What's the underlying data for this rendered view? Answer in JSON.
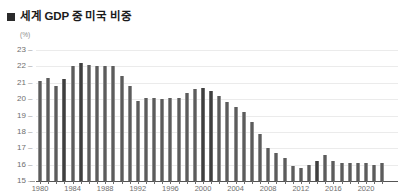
{
  "title": {
    "bullet": "square-bullet",
    "text": "세계 GDP 중 미국 비중"
  },
  "chart_data": {
    "type": "bar",
    "title": "세계 GDP 중 미국 비중",
    "unit_label": "(%)",
    "xlabel": "",
    "ylabel": "",
    "ylim": [
      15,
      23
    ],
    "ytick_values": [
      23,
      22,
      21,
      20,
      19,
      18,
      17,
      16,
      15
    ],
    "ytick_labels": [
      "23",
      "22",
      "21",
      "20",
      "19",
      "18",
      "17",
      "16",
      "15"
    ],
    "grid": true,
    "legend": "none",
    "xtick_labels": [
      "1980",
      "1984",
      "1988",
      "1992",
      "1996",
      "2000",
      "2004",
      "2008",
      "2012",
      "2016",
      "2020"
    ],
    "xtick_years": [
      1980,
      1984,
      1988,
      1992,
      1996,
      2000,
      2004,
      2008,
      2012,
      2016,
      2020
    ],
    "categories": [
      "1980",
      "1981",
      "1982",
      "1983",
      "1984",
      "1985",
      "1986",
      "1987",
      "1988",
      "1989",
      "1990",
      "1991",
      "1992",
      "1993",
      "1994",
      "1995",
      "1996",
      "1997",
      "1998",
      "1999",
      "2000",
      "2001",
      "2002",
      "2003",
      "2004",
      "2005",
      "2006",
      "2007",
      "2008",
      "2009",
      "2010",
      "2011",
      "2012",
      "2013",
      "2014",
      "2015",
      "2016",
      "2017",
      "2018",
      "2019",
      "2020",
      "2021",
      "2022"
    ],
    "values": [
      21.1,
      21.3,
      20.8,
      21.2,
      22.0,
      22.2,
      22.1,
      22.0,
      22.0,
      22.0,
      21.4,
      20.8,
      19.9,
      20.1,
      20.1,
      20.0,
      20.1,
      20.1,
      20.4,
      20.6,
      20.7,
      20.5,
      20.2,
      19.8,
      19.5,
      19.2,
      18.6,
      17.9,
      17.0,
      16.7,
      16.4,
      15.9,
      15.8,
      16.0,
      16.2,
      16.6,
      16.2,
      16.1,
      16.1,
      16.1,
      16.1,
      16.0,
      16.1
    ],
    "colors": {
      "bar": "#5c5c5c",
      "bar_accent": "#3f3f3f",
      "gridline": "#ebebeb",
      "axis": "#555555",
      "tick_text": "#6e6e6e",
      "title_text": "#1b1b1b",
      "background": "#ffffff"
    },
    "accent_indices": [
      3,
      5,
      20,
      21,
      34
    ]
  }
}
